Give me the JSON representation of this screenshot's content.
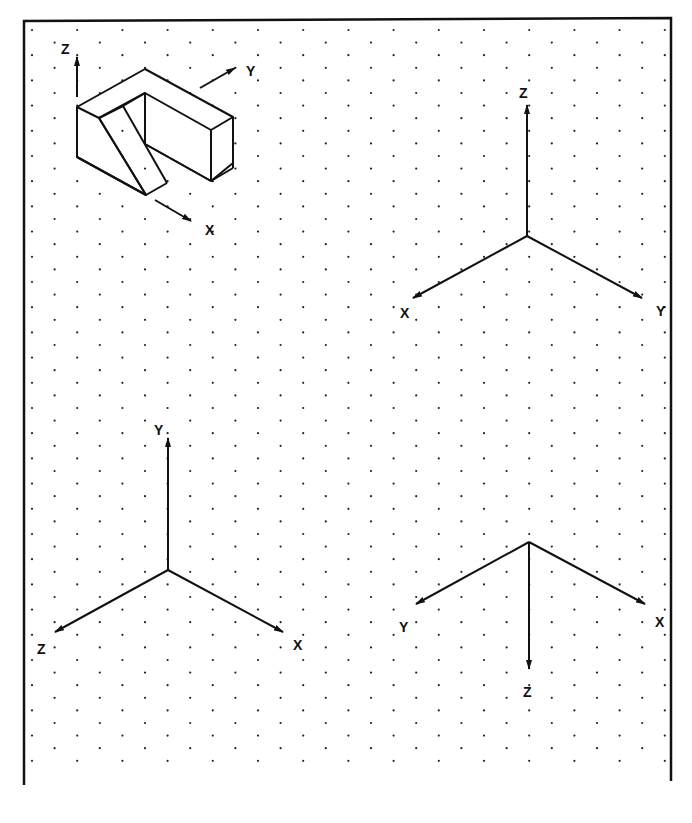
{
  "sheet": {
    "border": {
      "left": 24,
      "top": 21,
      "right": 671,
      "bottom": 785,
      "color": "#111111"
    },
    "grid": {
      "type": "isometric-dots",
      "x0": 32,
      "y0": 30,
      "col_spacing": 22.6,
      "row_spacing": 25.2,
      "color": "#222222"
    }
  },
  "object": {
    "name": "isometric-block-with-slot",
    "axes": {
      "z_label": "Z",
      "y_label": "Y",
      "x_label": "X"
    }
  },
  "axis_sets": [
    {
      "id": "top-right",
      "origin": [
        527,
        236
      ],
      "labels": {
        "up": "Z",
        "left": "X",
        "right": "Y"
      }
    },
    {
      "id": "bottom-left",
      "origin": [
        168,
        570
      ],
      "labels": {
        "up": "Y",
        "left": "Z",
        "right": "X"
      }
    },
    {
      "id": "bottom-right",
      "origin": [
        529,
        542
      ],
      "labels": {
        "down": "Z",
        "left": "Y",
        "right": "X"
      }
    }
  ]
}
